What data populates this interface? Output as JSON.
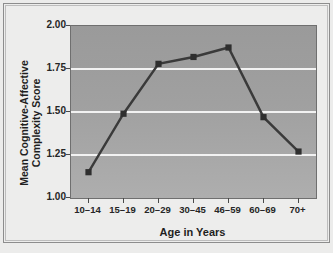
{
  "chart_data": {
    "type": "line",
    "title": "",
    "xlabel": "Age in Years",
    "ylabel_line1": "Mean Cognitive-Affective",
    "ylabel_line2": "Complexity Score",
    "categories": [
      "10–14",
      "15–19",
      "20–29",
      "30–45",
      "46–59",
      "60–69",
      "70+"
    ],
    "values": [
      1.15,
      1.49,
      1.78,
      1.82,
      1.875,
      1.47,
      1.27
    ],
    "ylim": [
      1.0,
      2.0
    ],
    "yticks": [
      "1.00",
      "1.25",
      "1.50",
      "1.75",
      "2.00"
    ],
    "ytick_values": [
      1.0,
      1.25,
      1.5,
      1.75,
      2.0
    ],
    "grid": true,
    "gridlines_at": [
      1.25,
      1.5,
      1.75
    ],
    "legend": "none",
    "series_name": "Mean Cognitive-Affective Complexity Score",
    "marker": "square",
    "colors": {
      "plot_background": "#a0a0a0",
      "line": "#3a3a3a",
      "marker": "#2e2e2e",
      "gridline": "#f2f2f2",
      "page_background": "#ededec",
      "axis_text": "#262626",
      "frame": "#8d8d8d"
    }
  }
}
